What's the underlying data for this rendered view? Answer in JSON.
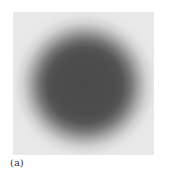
{
  "figure": {
    "panel_label": "(a)",
    "colors": {
      "background": "#e9e9e9",
      "disk": "#4a4a4a"
    }
  }
}
